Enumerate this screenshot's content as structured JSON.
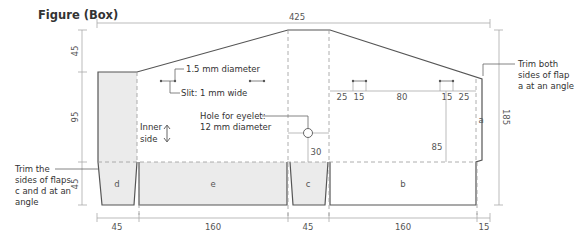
{
  "title": "Figure (Box)",
  "dimensions": {
    "top_total": "425",
    "left": [
      "45",
      "95",
      "45"
    ],
    "right_total": "185",
    "bottom": [
      "45",
      "160",
      "45",
      "160",
      "15"
    ],
    "slits_row": [
      "25",
      "15",
      "80",
      "15",
      "25"
    ],
    "eyelet_offset": "30",
    "vertical_85": "85"
  },
  "flaps": {
    "a": "a",
    "b": "b",
    "c": "c",
    "d": "d",
    "e": "e"
  },
  "annotations": {
    "hole_diameter": "1.5 mm diameter",
    "slit": "Slit: 1 mm wide",
    "eyelet_line1": "Hole for eyelet:",
    "eyelet_line2": "12 mm diameter",
    "inner_line1": "Inner",
    "inner_line2": "side",
    "trim_a_line1": "Trim both",
    "trim_a_line2": "sides of flap",
    "trim_a_line3": "a at an angle",
    "trim_cd_line1": "Trim the",
    "trim_cd_line2": "sides of flaps",
    "trim_cd_line3": "c and d at an",
    "trim_cd_line4": "angle"
  },
  "colors": {
    "outline": "#555555",
    "shade": "#ebebeb",
    "dimension": "#aaaaaa"
  }
}
